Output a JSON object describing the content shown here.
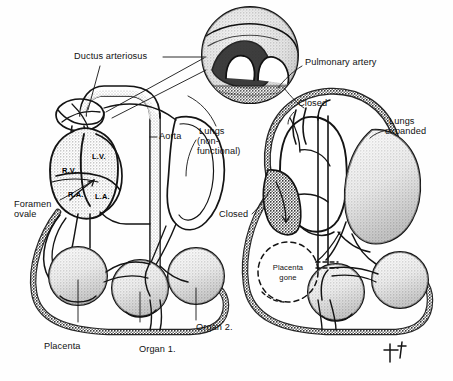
{
  "figure": {
    "signature": "monogram",
    "ink_color": "#141414",
    "paper_color": "#fefefe",
    "stipple_color": "#9a9a9a"
  },
  "inset": {
    "name": "ductus-arteriosus-magnified-inset",
    "caption": ""
  },
  "left_panel": {
    "name": "fetal-circulation",
    "labels": {
      "ductus_arteriosus": "Ductus arteriosus",
      "aorta": "Aorta",
      "lungs_line1": "Lungs",
      "lungs_line2": "(non-",
      "lungs_line3": "functional)",
      "foramen_line1": "Foramen",
      "foramen_line2": "ovale",
      "placenta": "Placenta",
      "organ_1": "Organ 1.",
      "organ_2": "Organ 2."
    },
    "heart_chambers": {
      "right_ventricle": "R.V.",
      "left_ventricle": "L.V.",
      "right_atrium": "R.A.",
      "left_atrium": "L.A."
    }
  },
  "right_panel": {
    "name": "newborn-circulation",
    "labels": {
      "pulmonary_artery": "Pulmonary artery",
      "closed_ductus": "Closed",
      "closed_foramen": "Closed",
      "lungs_line1": "Lungs",
      "lungs_line2": "expanded",
      "placenta_gone_line1": "Placenta",
      "placenta_gone_line2": "gone"
    }
  }
}
